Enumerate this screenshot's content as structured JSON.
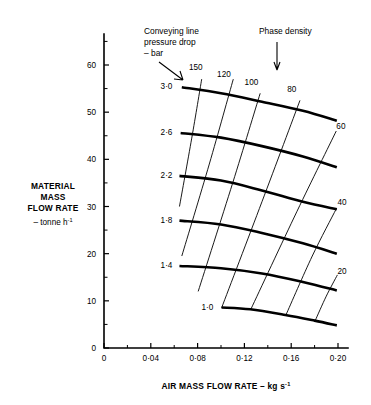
{
  "chart_data": {
    "type": "line",
    "title": "",
    "xlabel": "AIR MASS FLOW RATE – kg s-1",
    "xlabel_main": "AIR MASS FLOW RATE",
    "xlabel_dash": "–",
    "xlabel_unit": "kg s",
    "xlabel_unit_sup": "-1",
    "ylabel_line1": "MATERIAL",
    "ylabel_line2": "MASS",
    "ylabel_line3": "FLOW RATE",
    "ylabel_unit": "– tonne h",
    "ylabel_unit_sup": "-1",
    "xlim": [
      0,
      0.21
    ],
    "ylim": [
      0,
      66
    ],
    "grid": false,
    "legend": "none",
    "x_ticks": [
      "0",
      "0·04",
      "0·08",
      "0·12",
      "0·16",
      "0·20"
    ],
    "x_tick_values": [
      0,
      0.04,
      0.08,
      0.12,
      0.16,
      0.2
    ],
    "x_minor_values": [
      0.02,
      0.06,
      0.1,
      0.14,
      0.18
    ],
    "y_ticks": [
      "0",
      "10",
      "20",
      "30",
      "40",
      "50",
      "60"
    ],
    "y_tick_values": [
      0,
      10,
      20,
      30,
      40,
      50,
      60
    ],
    "y_minor_values": [
      5,
      15,
      25,
      35,
      45,
      55,
      65
    ],
    "annotations": [
      {
        "name": "pressure-drop-annotation",
        "line1": "Conveying line",
        "line2": "pressure drop",
        "line3": "– bar",
        "x": 0.035,
        "y": 65
      },
      {
        "name": "phase-density-annotation",
        "line1": "Phase density",
        "x": 0.125,
        "y": 65
      }
    ],
    "series": [
      {
        "name": "pressure-drop-3.0",
        "family": "conveying line pressure drop – bar",
        "label": "3·0",
        "label_x": 0.0585,
        "label_y": 55.5,
        "points": [
          [
            0.0665,
            55.3
          ],
          [
            0.1,
            54.0
          ],
          [
            0.135,
            52.2
          ],
          [
            0.17,
            50.3
          ],
          [
            0.199,
            48.2
          ]
        ]
      },
      {
        "name": "pressure-drop-2.6",
        "family": "conveying line pressure drop – bar",
        "label": "2·6",
        "label_x": 0.0585,
        "label_y": 45.7,
        "points": [
          [
            0.0655,
            45.6
          ],
          [
            0.1,
            44.6
          ],
          [
            0.135,
            42.8
          ],
          [
            0.17,
            40.6
          ],
          [
            0.199,
            38.3
          ]
        ]
      },
      {
        "name": "pressure-drop-2.2",
        "family": "conveying line pressure drop – bar",
        "label": "2·2",
        "label_x": 0.0585,
        "label_y": 36.6,
        "points": [
          [
            0.0645,
            36.5
          ],
          [
            0.1,
            35.5
          ],
          [
            0.135,
            33.4
          ],
          [
            0.17,
            31.0
          ],
          [
            0.199,
            29.4
          ]
        ]
      },
      {
        "name": "pressure-drop-1.8",
        "family": "conveying line pressure drop – bar",
        "label": "1·8",
        "label_x": 0.0585,
        "label_y": 27.2,
        "points": [
          [
            0.0645,
            27.0
          ],
          [
            0.1,
            26.2
          ],
          [
            0.135,
            24.4
          ],
          [
            0.17,
            22.2
          ],
          [
            0.199,
            20.0
          ]
        ]
      },
      {
        "name": "pressure-drop-1.4",
        "family": "conveying line pressure drop – bar",
        "label": "1·4",
        "label_x": 0.0585,
        "label_y": 17.7,
        "points": [
          [
            0.0645,
            17.4
          ],
          [
            0.1,
            16.9
          ],
          [
            0.135,
            15.8
          ],
          [
            0.17,
            14.0
          ],
          [
            0.199,
            12.2
          ]
        ]
      },
      {
        "name": "pressure-drop-1.0",
        "family": "conveying line pressure drop – bar",
        "label": "1·0",
        "label_x": 0.0935,
        "label_y": 8.7,
        "points": [
          [
            0.1005,
            8.6
          ],
          [
            0.125,
            8.2
          ],
          [
            0.155,
            7.0
          ],
          [
            0.18,
            5.8
          ],
          [
            0.199,
            4.8
          ]
        ]
      },
      {
        "name": "phase-density-150",
        "family": "phase density",
        "label": "150",
        "label_x": 0.0785,
        "label_y": 59.5,
        "points": [
          [
            0.0645,
            30.0
          ],
          [
            0.075,
            44.5
          ],
          [
            0.0835,
            57.0
          ]
        ]
      },
      {
        "name": "phase-density-120",
        "family": "phase density",
        "label": "120",
        "label_x": 0.1025,
        "label_y": 58.0,
        "points": [
          [
            0.0665,
            19.5
          ],
          [
            0.09,
            39.0
          ],
          [
            0.1105,
            57.0
          ]
        ]
      },
      {
        "name": "phase-density-100",
        "family": "phase density",
        "label": "100",
        "label_x": 0.126,
        "label_y": 56.5,
        "points": [
          [
            0.0805,
            12.0
          ],
          [
            0.11,
            35.0
          ],
          [
            0.1335,
            54.0
          ]
        ]
      },
      {
        "name": "phase-density-80",
        "family": "phase density",
        "label": "80",
        "label_x": 0.1605,
        "label_y": 55.0,
        "points": [
          [
            0.1005,
            8.5
          ],
          [
            0.135,
            31.0
          ],
          [
            0.1675,
            52.5
          ]
        ]
      },
      {
        "name": "phase-density-60",
        "family": "phase density",
        "label": "60",
        "label_x": 0.2025,
        "label_y": 47.0,
        "points": [
          [
            0.1255,
            8.2
          ],
          [
            0.165,
            29.0
          ],
          [
            0.1985,
            46.0
          ]
        ]
      },
      {
        "name": "phase-density-40",
        "family": "phase density",
        "label": "40",
        "label_x": 0.2035,
        "label_y": 31.0,
        "points": [
          [
            0.1555,
            7.0
          ],
          [
            0.178,
            19.5
          ],
          [
            0.1985,
            29.5
          ]
        ]
      },
      {
        "name": "phase-density-20",
        "family": "phase density",
        "label": "20",
        "label_x": 0.2035,
        "label_y": 16.3,
        "points": [
          [
            0.1805,
            5.8
          ],
          [
            0.19,
            11.0
          ],
          [
            0.1995,
            15.5
          ]
        ]
      }
    ]
  }
}
